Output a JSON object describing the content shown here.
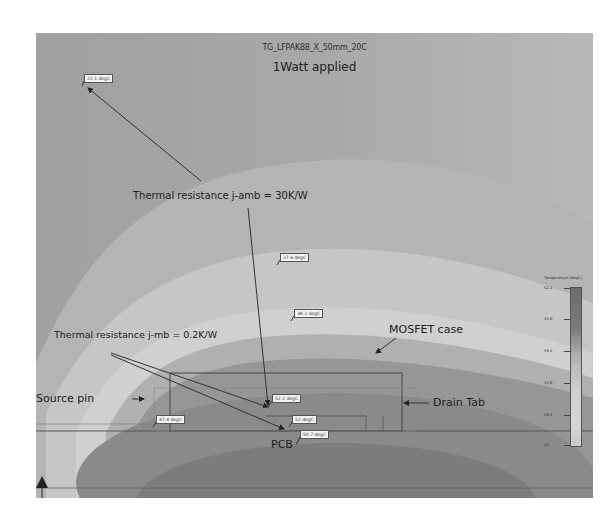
{
  "header": {
    "model_name": "TG_LFPAK88_X_50mm_20C",
    "condition": "1Watt applied"
  },
  "temperature_probes": [
    {
      "id": "ambient-top",
      "label": "22.1 degC"
    },
    {
      "id": "mid-air",
      "label": "27.6 degC"
    },
    {
      "id": "above-case",
      "label": "38.2 degC"
    },
    {
      "id": "junction",
      "label": "52.2 degC"
    },
    {
      "id": "source-pin",
      "label": "47.4 degC"
    },
    {
      "id": "mounting-base",
      "label": "52 degC"
    },
    {
      "id": "pcb",
      "label": "50.7 degC"
    }
  ],
  "annotations": {
    "rth_j_amb": "Thermal resistance j-amb = 30K/W",
    "rth_j_mb": "Thermal resistance j-mb = 0.2K/W",
    "mosfet_case": "MOSFET case",
    "drain_tab": "Drain Tab",
    "source_pin": "Source pin",
    "pcb": "PCB"
  },
  "legend": {
    "title": "Temperature (degC)",
    "ticks": [
      "52.2",
      "45.8",
      "39.2",
      "32.6",
      "26.4",
      "20"
    ]
  },
  "colors": {
    "background": "#a7a7a7",
    "hot": "#6c6c6c",
    "cool": "#d6d6d6",
    "line": "#333333"
  }
}
